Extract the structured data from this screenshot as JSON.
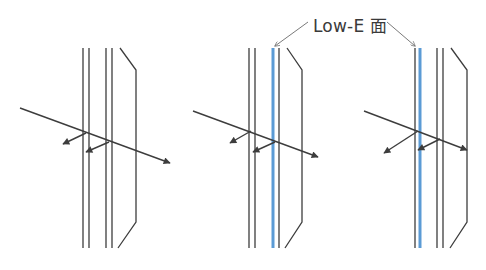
{
  "annotation": {
    "text": "Low-E 面",
    "x": 313,
    "y": 12
  },
  "colors": {
    "line": "#3d3d3d",
    "lowe": "#5b9bd5",
    "leader": "#7a7a7a"
  },
  "panels": [
    {
      "name": "ordinary-double-glazing",
      "panes": [
        83,
        89,
        106,
        112
      ],
      "lowe_pane_index": null,
      "frame": [
        [
          120,
          48
        ],
        [
          136,
          70
        ],
        [
          136,
          222
        ],
        [
          118,
          248
        ]
      ],
      "ray": [
        [
          20,
          108
        ],
        [
          170,
          163
        ]
      ],
      "reflections": [
        [
          [
            86,
            133
          ],
          [
            63,
            144
          ]
        ],
        [
          [
            109,
            142
          ],
          [
            86,
            152
          ]
        ]
      ]
    },
    {
      "name": "lowe-surface-3",
      "panes": [
        249,
        255,
        273,
        279
      ],
      "lowe_pane_index": 2,
      "frame": [
        [
          287,
          48
        ],
        [
          302,
          70
        ],
        [
          302,
          222
        ],
        [
          285,
          248
        ]
      ],
      "ray": [
        [
          193,
          111
        ],
        [
          318,
          157
        ]
      ],
      "reflections": [
        [
          [
            251,
            131
          ],
          [
            230,
            143
          ]
        ],
        [
          [
            275,
            142
          ],
          [
            253,
            152
          ]
        ]
      ]
    },
    {
      "name": "lowe-surface-2",
      "panes": [
        415,
        420,
        437,
        443
      ],
      "lowe_pane_index": 1,
      "frame": [
        [
          451,
          48
        ],
        [
          467,
          70
        ],
        [
          467,
          222
        ],
        [
          450,
          248
        ]
      ],
      "ray": [
        [
          364,
          111
        ],
        [
          467,
          150
        ]
      ],
      "reflections": [
        [
          [
            418,
            131
          ],
          [
            384,
            153
          ]
        ],
        [
          [
            440,
            139
          ],
          [
            418,
            150
          ]
        ]
      ]
    }
  ],
  "leaders": [
    [
      [
        308,
        22
      ],
      [
        275,
        46
      ]
    ],
    [
      [
        387,
        22
      ],
      [
        415,
        46
      ]
    ]
  ],
  "pane_top": 48,
  "pane_bottom": 248
}
